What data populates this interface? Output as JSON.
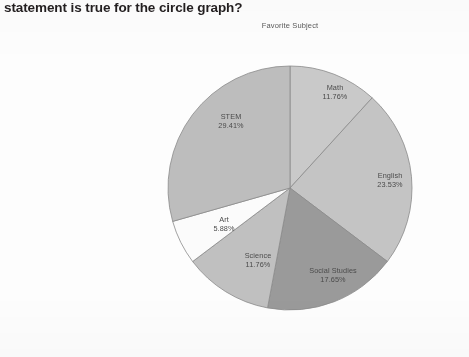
{
  "question": {
    "text": "statement is true for the circle graph?"
  },
  "chart_data": {
    "type": "pie",
    "title": "Favorite Subject",
    "xlabel": "",
    "ylabel": "",
    "legend_position": "none",
    "labels_on_slices": true,
    "start_angle_deg": 0,
    "direction": "clockwise",
    "categories": [
      "Math",
      "English",
      "Social Studies",
      "Science",
      "Art",
      "STEM"
    ],
    "values": [
      11.76,
      23.53,
      17.65,
      11.76,
      5.88,
      29.41
    ],
    "value_labels": [
      "11.76%",
      "23.53%",
      "17.65%",
      "11.76%",
      "5.88%",
      "29.41%"
    ],
    "slice_colors": [
      "#c9c9c9",
      "#c4c4c4",
      "#9a9a9a",
      "#c0c0c0",
      "#fbfbfb",
      "#bdbdbd"
    ],
    "slice_edge_color": "#8a8a8a",
    "total": 100.0,
    "slices": [
      {
        "label": "Math",
        "value": 11.76,
        "value_label": "11.76%",
        "color": "#c9c9c9"
      },
      {
        "label": "English",
        "value": 23.53,
        "value_label": "23.53%",
        "color": "#c4c4c4"
      },
      {
        "label": "Social Studies",
        "value": 17.65,
        "value_label": "17.65%",
        "color": "#9a9a9a"
      },
      {
        "label": "Science",
        "value": 11.76,
        "value_label": "11.76%",
        "color": "#c0c0c0"
      },
      {
        "label": "Art",
        "value": 5.88,
        "value_label": "5.88%",
        "color": "#fbfbfb"
      },
      {
        "label": "STEM",
        "value": 29.41,
        "value_label": "29.41%",
        "color": "#bdbdbd"
      }
    ]
  },
  "label_positions": [
    {
      "x": 335,
      "y": 90
    },
    {
      "x": 390,
      "y": 178
    },
    {
      "x": 333,
      "y": 273
    },
    {
      "x": 258,
      "y": 258
    },
    {
      "x": 224,
      "y": 222
    },
    {
      "x": 231,
      "y": 119
    }
  ]
}
